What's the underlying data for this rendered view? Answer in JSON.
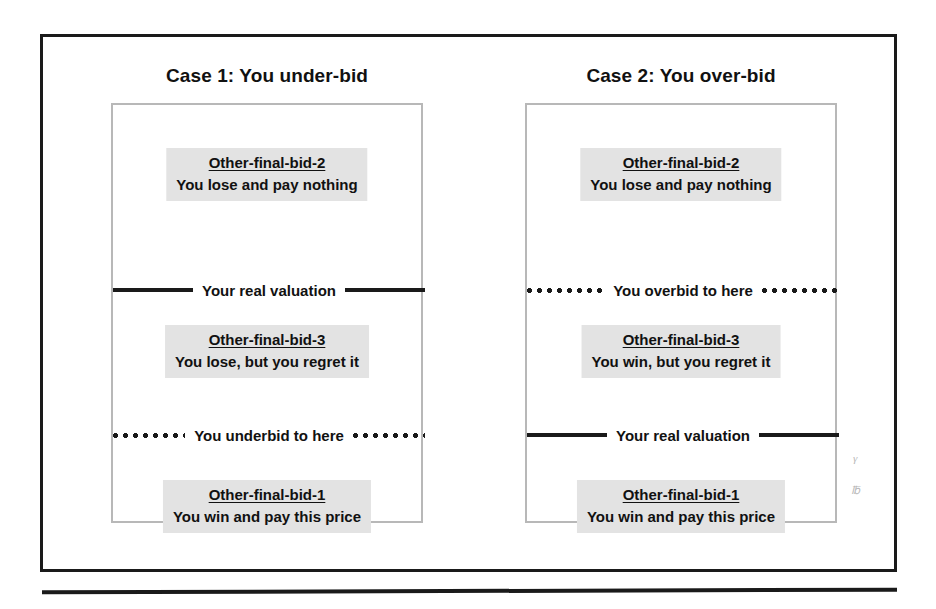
{
  "figure": {
    "cases": [
      {
        "id": "case-1",
        "title": "Case 1: You under-bid",
        "slots": [
          {
            "position": "top",
            "label": "Other-final-bid-2",
            "text": "You lose and pay nothing"
          },
          {
            "position": "mid",
            "label": "Other-final-bid-3",
            "text": "You lose, but you regret it"
          },
          {
            "position": "bottom",
            "label": "Other-final-bid-1",
            "text": "You win and pay this price"
          }
        ],
        "markers": [
          {
            "position": "upper",
            "style": "solid",
            "text": "Your real valuation"
          },
          {
            "position": "lower",
            "style": "dotted",
            "text": "You underbid to here"
          }
        ]
      },
      {
        "id": "case-2",
        "title": "Case 2: You over-bid",
        "slots": [
          {
            "position": "top",
            "label": "Other-final-bid-2",
            "text": "You lose and pay nothing"
          },
          {
            "position": "mid",
            "label": "Other-final-bid-3",
            "text": "You win, but you regret it"
          },
          {
            "position": "bottom",
            "label": "Other-final-bid-1",
            "text": "You win and pay this price"
          }
        ],
        "markers": [
          {
            "position": "upper",
            "style": "dotted",
            "text": "You overbid to here"
          },
          {
            "position": "lower",
            "style": "solid",
            "text": "Your real valuation"
          }
        ]
      }
    ]
  },
  "colors": {
    "frame_border": "#1a1a1a",
    "panel_border": "#b8b8b8",
    "highlight_background": "#e3e3e3",
    "text": "#111111",
    "page_background": "#ffffff"
  }
}
